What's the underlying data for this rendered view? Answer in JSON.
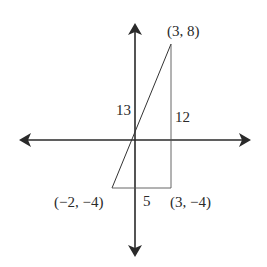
{
  "diagram": {
    "type": "coordinate-plane right triangle",
    "axes": {
      "x_axis": "horizontal with arrows both ends",
      "y_axis": "vertical with arrows both ends"
    },
    "vertices": [
      {
        "label": "(3, 8)",
        "x": 3,
        "y": 8
      },
      {
        "label": "(3, −4)",
        "x": 3,
        "y": -4
      },
      {
        "label": "(−2, −4)",
        "x": -2,
        "y": -4
      }
    ],
    "side_labels": {
      "hypotenuse": "13",
      "vertical_leg": "12",
      "horizontal_leg": "5"
    },
    "colors": {
      "line": "#2a2a2a",
      "thin_line": "#555555"
    }
  }
}
